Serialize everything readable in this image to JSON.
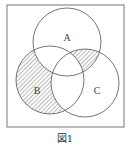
{
  "diagram": {
    "type": "venn",
    "sets": [
      {
        "id": "A",
        "label": "A"
      },
      {
        "id": "B",
        "label": "B"
      },
      {
        "id": "C",
        "label": "C"
      }
    ],
    "hatched_regions": [
      "B only",
      "A∩C minus B"
    ],
    "caption": "図1",
    "colors": {
      "stroke": "#666666",
      "hatch": "#555555",
      "frame": "#777777"
    }
  }
}
